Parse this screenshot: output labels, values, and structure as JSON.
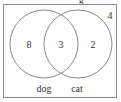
{
  "diagram": {
    "type": "venn",
    "title_fragment": "g",
    "sets": [
      {
        "name": "dog",
        "label": "dog",
        "only_count": "8"
      },
      {
        "name": "cat",
        "label": "cat",
        "only_count": "2"
      }
    ],
    "intersection_count": "3",
    "outside_count": "4",
    "colors": {
      "stroke": "#8a8a8a",
      "text": "#333333",
      "background": "#ffffff"
    }
  }
}
